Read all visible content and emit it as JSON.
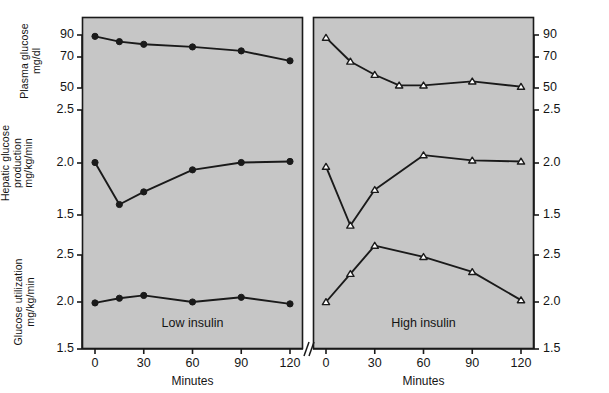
{
  "figure": {
    "background": "#ffffff",
    "plot_background": "#c6c6c6",
    "line_color": "#1a1a1a",
    "axis_color": "#1a1a1a"
  },
  "axes": {
    "x_title": "Minutes",
    "x_ticks": [
      "0",
      "30",
      "60",
      "90",
      "120"
    ],
    "x_tick_values": [
      0,
      30,
      60,
      90,
      120
    ],
    "x_range": [
      -8,
      128
    ],
    "y_sections": [
      {
        "name": "plasma-glucose",
        "title_lines": [
          "Plasma glucose",
          "mg/dl"
        ],
        "ticks": [
          "90",
          "70",
          "50"
        ],
        "tick_values": [
          90,
          70,
          50
        ],
        "range": [
          47,
          97
        ]
      },
      {
        "name": "hepatic-glucose-production",
        "title_lines": [
          "Hepatic glucose",
          "production",
          "mg/kg/min"
        ],
        "ticks": [
          "2.5",
          "2.0",
          "1.5"
        ],
        "tick_values": [
          2.5,
          2.0,
          1.5
        ],
        "range": [
          1.4,
          2.6
        ]
      },
      {
        "name": "glucose-utilization",
        "title_lines": [
          "Glucose utilization",
          "mg/kg/min"
        ],
        "ticks": [
          "2.5",
          "2.0",
          "1.5"
        ],
        "tick_values": [
          2.5,
          2.0,
          1.5
        ],
        "range": [
          1.45,
          2.6
        ]
      }
    ]
  },
  "panels": [
    {
      "id": "low-insulin",
      "label": "Low insulin",
      "marker": "filled-circle",
      "series": [
        {
          "name": "plasma-glucose",
          "x": [
            0,
            15,
            30,
            60,
            90,
            120
          ],
          "y": [
            89,
            85,
            83,
            81,
            78,
            70.5
          ]
        },
        {
          "name": "hepatic-glucose-production",
          "x": [
            0,
            15,
            30,
            60,
            90,
            120
          ],
          "y": [
            2.0,
            1.6,
            1.72,
            1.93,
            2.0,
            2.01
          ]
        },
        {
          "name": "glucose-utilization",
          "x": [
            0,
            15,
            30,
            60,
            90,
            120
          ],
          "y": [
            1.99,
            2.04,
            2.07,
            2.0,
            2.05,
            1.98
          ]
        }
      ]
    },
    {
      "id": "high-insulin",
      "label": "High insulin",
      "marker": "open-triangle",
      "series": [
        {
          "name": "plasma-glucose",
          "x": [
            0,
            15,
            30,
            45,
            60,
            90,
            120
          ],
          "y": [
            88,
            70,
            60,
            52,
            52,
            55,
            51
          ]
        },
        {
          "name": "hepatic-glucose-production",
          "x": [
            0,
            15,
            30,
            60,
            90,
            120
          ],
          "y": [
            1.96,
            1.4,
            1.74,
            2.07,
            2.02,
            2.01
          ]
        },
        {
          "name": "glucose-utilization",
          "x": [
            0,
            15,
            30,
            60,
            90,
            120
          ],
          "y": [
            2.0,
            2.3,
            2.6,
            2.48,
            2.32,
            2.02
          ]
        }
      ]
    }
  ],
  "axis_break": {
    "name": "axis-break-symbol",
    "present": true
  }
}
